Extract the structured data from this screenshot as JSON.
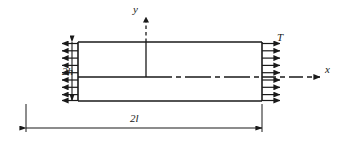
{
  "diagram": {
    "type": "mechanics-free-body-diagram",
    "labels": {
      "axis_y": "y",
      "axis_x": "x",
      "load": "T",
      "height_dimension": "2h",
      "length_dimension": "2l"
    },
    "colors": {
      "stroke": "#1a1a1a",
      "background": "#ffffff",
      "text": "#1a1a1a"
    },
    "geometry": {
      "body_left": 78,
      "body_right": 262,
      "body_top": 42,
      "body_bottom": 101,
      "axis_origin_x": 146,
      "axis_origin_y": 77,
      "traction_arrow_count": 9,
      "traction_arrow_length": 18
    }
  }
}
